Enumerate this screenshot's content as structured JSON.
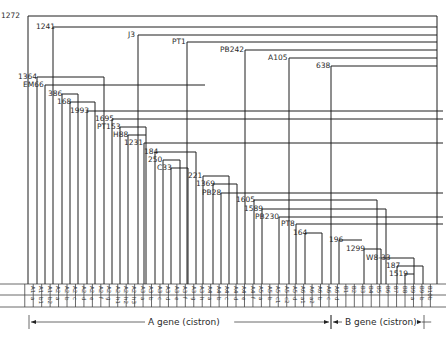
{
  "diagram": {
    "type": "deletion-map",
    "colors": {
      "line": "#1e1e1e",
      "text": "#2a2a2a",
      "background": "#ffffff"
    },
    "grid": {
      "x0": 29,
      "dx": 8.45,
      "count": 48,
      "row_top": 284,
      "row_mid": 295,
      "row_bottom": 307,
      "left": 0,
      "right": 446
    },
    "segments": [
      {
        "gene": "A1",
        "sub": "a"
      },
      {
        "gene": "A1",
        "sub": "b1"
      },
      {
        "gene": "A1",
        "sub": "b2"
      },
      {
        "gene": "A2",
        "sub": "a"
      },
      {
        "gene": "A2",
        "sub": "b"
      },
      {
        "gene": "A2",
        "sub": "c"
      },
      {
        "gene": "A2",
        "sub": "d"
      },
      {
        "gene": "A2",
        "sub": "e"
      },
      {
        "gene": "A2",
        "sub": "f"
      },
      {
        "gene": "A2",
        "sub": "g"
      },
      {
        "gene": "A2",
        "sub": "h1"
      },
      {
        "gene": "A2",
        "sub": "h2"
      },
      {
        "gene": "A2",
        "sub": "h3"
      },
      {
        "gene": "A3",
        "sub": "a"
      },
      {
        "gene": "A3",
        "sub": "b"
      },
      {
        "gene": "A3",
        "sub": "c"
      },
      {
        "gene": "A3",
        "sub": "d"
      },
      {
        "gene": "A3",
        "sub": "e"
      },
      {
        "gene": "A3",
        "sub": "f"
      },
      {
        "gene": "A3",
        "sub": "g"
      },
      {
        "gene": "A3",
        "sub": "h"
      },
      {
        "gene": "A4",
        "sub": "a"
      },
      {
        "gene": "A4",
        "sub": "b"
      },
      {
        "gene": "A4",
        "sub": "c"
      },
      {
        "gene": "A4",
        "sub": "d"
      },
      {
        "gene": "A4",
        "sub": "e"
      },
      {
        "gene": "A4",
        "sub": "f"
      },
      {
        "gene": "A5",
        "sub": "a"
      },
      {
        "gene": "A5",
        "sub": "b"
      },
      {
        "gene": "A5",
        "sub": "c1"
      },
      {
        "gene": "A5",
        "sub": "c2"
      },
      {
        "gene": "A5",
        "sub": "d"
      },
      {
        "gene": "A6",
        "sub": "a1"
      },
      {
        "gene": "A6",
        "sub": "a2"
      },
      {
        "gene": "A6",
        "sub": "b"
      },
      {
        "gene": "A6",
        "sub": "c"
      },
      {
        "gene": "A6",
        "sub": "d"
      },
      {
        "gene": "B1",
        "sub": ""
      },
      {
        "gene": "B2",
        "sub": ""
      },
      {
        "gene": "B3",
        "sub": ""
      },
      {
        "gene": "B4",
        "sub": ""
      },
      {
        "gene": "B5",
        "sub": ""
      },
      {
        "gene": "B6",
        "sub": ""
      },
      {
        "gene": "B7",
        "sub": ""
      },
      {
        "gene": "B8",
        "sub": ""
      },
      {
        "gene": "B9",
        "sub": "a"
      },
      {
        "gene": "B9",
        "sub": "b"
      },
      {
        "gene": "B10",
        "sub": "b"
      }
    ],
    "deletions": [
      {
        "name": "1272",
        "lx": 1,
        "ly": 18,
        "y": 16,
        "x1": 28,
        "x2": 437,
        "drop": [
          28,
          437
        ]
      },
      {
        "name": "1241",
        "lx": 36,
        "ly": 29,
        "y": 27,
        "x1": 53,
        "x2": 437,
        "drop": [
          53
        ]
      },
      {
        "name": "J3",
        "lx": 128,
        "ly": 37,
        "y": 35,
        "x1": 138,
        "x2": 437,
        "drop": [
          138
        ]
      },
      {
        "name": "PT1",
        "lx": 172,
        "ly": 44,
        "y": 42,
        "x1": 187,
        "x2": 437,
        "drop": [
          187
        ]
      },
      {
        "name": "PB242",
        "lx": 220,
        "ly": 52,
        "y": 50,
        "x1": 245,
        "x2": 437,
        "drop": [
          245
        ]
      },
      {
        "name": "A105",
        "lx": 268,
        "ly": 60,
        "y": 58,
        "x1": 289,
        "x2": 437,
        "drop": [
          289
        ]
      },
      {
        "name": "638",
        "lx": 316,
        "ly": 68,
        "y": 66,
        "x1": 331,
        "x2": 437,
        "drop": [
          331
        ]
      },
      {
        "name": "1364",
        "lx": 18,
        "ly": 79,
        "y": 77,
        "x1": 37,
        "x2": 104,
        "drop": [
          37,
          104
        ]
      },
      {
        "name": "EM66",
        "lx": 23,
        "ly": 87,
        "y": 85,
        "x1": 45,
        "x2": 205,
        "drop": [
          45
        ]
      },
      {
        "name": "386",
        "lx": 48,
        "ly": 96,
        "y": 94,
        "x1": 62,
        "x2": 78,
        "drop": [
          62,
          78
        ]
      },
      {
        "name": "168",
        "lx": 57,
        "ly": 104,
        "y": 102,
        "x1": 70,
        "x2": 95,
        "drop": [
          70,
          95
        ]
      },
      {
        "name": "1993",
        "lx": 70,
        "ly": 113,
        "y": 111,
        "x1": 87,
        "x2": 443,
        "drop": [
          87
        ]
      },
      {
        "name": "1695",
        "lx": 95,
        "ly": 121,
        "y": 119,
        "x1": 112,
        "x2": 443,
        "drop": [
          112
        ]
      },
      {
        "name": "PT153",
        "lx": 97,
        "ly": 129,
        "y": 127,
        "x1": 120,
        "x2": 146,
        "drop": [
          120,
          146
        ]
      },
      {
        "name": "H88",
        "lx": 113,
        "ly": 137,
        "y": 135,
        "x1": 128,
        "x2": 146,
        "drop": [
          128
        ]
      },
      {
        "name": "1231",
        "lx": 124,
        "ly": 145,
        "y": 143,
        "x1": 144,
        "x2": 443,
        "drop": [
          144
        ]
      },
      {
        "name": "184",
        "lx": 144,
        "ly": 154,
        "y": 152,
        "x1": 155,
        "x2": 196,
        "drop": [
          155,
          196
        ]
      },
      {
        "name": "250",
        "lx": 148,
        "ly": 162,
        "y": 160,
        "x1": 163,
        "x2": 180,
        "drop": [
          163,
          180
        ]
      },
      {
        "name": "C33",
        "lx": 157,
        "ly": 170,
        "y": 168,
        "x1": 171,
        "x2": 188,
        "drop": [
          171,
          188
        ]
      },
      {
        "name": "221",
        "lx": 188,
        "ly": 178,
        "y": 176,
        "x1": 203,
        "x2": 229,
        "drop": [
          203,
          229
        ]
      },
      {
        "name": "1369",
        "lx": 196,
        "ly": 186,
        "y": 184,
        "x1": 213,
        "x2": 237,
        "drop": [
          213,
          237
        ]
      },
      {
        "name": "PB28",
        "lx": 202,
        "ly": 195,
        "y": 193,
        "x1": 221,
        "x2": 443,
        "drop": [
          221
        ]
      },
      {
        "name": "1605",
        "lx": 236,
        "ly": 202,
        "y": 200,
        "x1": 254,
        "x2": 377,
        "drop": [
          254,
          377
        ]
      },
      {
        "name": "1589",
        "lx": 244,
        "ly": 211,
        "y": 209,
        "x1": 262,
        "x2": 386,
        "drop": [
          262,
          386
        ]
      },
      {
        "name": "PB230",
        "lx": 255,
        "ly": 219,
        "y": 217,
        "x1": 279,
        "x2": 443,
        "drop": [
          279
        ]
      },
      {
        "name": "PT8",
        "lx": 281,
        "ly": 226,
        "y": 224,
        "x1": 296,
        "x2": 443,
        "drop": [
          296
        ]
      },
      {
        "name": "164",
        "lx": 293,
        "ly": 235,
        "y": 233,
        "x1": 305,
        "x2": 322,
        "drop": [
          305,
          322
        ]
      },
      {
        "name": "196",
        "lx": 329,
        "ly": 242,
        "y": 240,
        "x1": 339,
        "x2": 362,
        "drop": [
          339
        ]
      },
      {
        "name": "1299",
        "lx": 346,
        "ly": 251,
        "y": 249,
        "x1": 364,
        "x2": 381,
        "drop": [
          364,
          381
        ]
      },
      {
        "name": "W8-33",
        "lx": 366,
        "ly": 260,
        "y": 258,
        "x1": 381,
        "x2": 414,
        "drop": [
          414
        ]
      },
      {
        "name": "187",
        "lx": 386,
        "ly": 268,
        "y": 266,
        "x1": 397,
        "x2": 423,
        "drop": [
          397,
          423
        ]
      },
      {
        "name": "1519",
        "lx": 389,
        "ly": 276,
        "y": 274,
        "x1": 405,
        "x2": 414,
        "drop": [
          405
        ]
      }
    ],
    "genes": [
      {
        "label": "A gene (cistron)",
        "x1": 29,
        "x2": 331,
        "y": 322,
        "text_x": 148
      },
      {
        "label": "B gene (cistron)",
        "x1": 331,
        "x2": 424,
        "y": 322,
        "text_x": 345
      }
    ]
  }
}
